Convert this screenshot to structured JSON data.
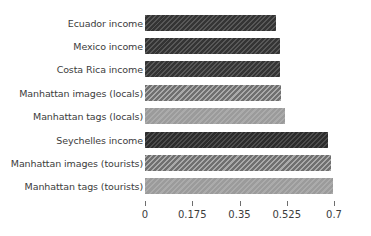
{
  "chart_data": {
    "type": "bar",
    "orientation": "horizontal",
    "title": "",
    "subtitle": "",
    "xlabel": "",
    "ylabel": "",
    "xlim": [
      0,
      0.7
    ],
    "ylim": null,
    "grid": false,
    "legend": null,
    "xticks": [
      "0",
      "0.175",
      "0.35",
      "0.525",
      "0.7"
    ],
    "xtick_values": [
      0,
      0.175,
      0.35,
      0.525,
      0.7
    ],
    "categories": [
      "Ecuador income",
      "Mexico income",
      "Costa Rica income",
      "Manhattan images (locals)",
      "Manhattan tags (locals)",
      "Seychelles income",
      "Manhattan images (tourists)",
      "Manhattan tags (tourists)"
    ],
    "values": [
      0.485,
      0.5,
      0.5,
      0.504,
      0.519,
      0.678,
      0.689,
      0.696
    ],
    "bars": [
      {
        "label": "Ecuador income",
        "value": 0.485,
        "style": "fill-dark",
        "color": "#3f3f3f"
      },
      {
        "label": "Mexico income",
        "value": 0.5,
        "style": "fill-dark",
        "color": "#3f3f3f"
      },
      {
        "label": "Costa Rica income",
        "value": 0.5,
        "style": "fill-dark",
        "color": "#3f3f3f"
      },
      {
        "label": "Manhattan images (locals)",
        "value": 0.504,
        "style": "fill-mid",
        "color": "#848484"
      },
      {
        "label": "Manhattan tags (locals)",
        "value": 0.519,
        "style": "fill-light",
        "color": "#a2a2a2"
      },
      {
        "label": "Seychelles income",
        "value": 0.678,
        "style": "fill-darkest",
        "color": "#373737"
      },
      {
        "label": "Manhattan images (tourists)",
        "value": 0.689,
        "style": "fill-mid",
        "color": "#848484"
      },
      {
        "label": "Manhattan tags (tourists)",
        "value": 0.696,
        "style": "fill-light",
        "color": "#a2a2a2"
      }
    ]
  }
}
